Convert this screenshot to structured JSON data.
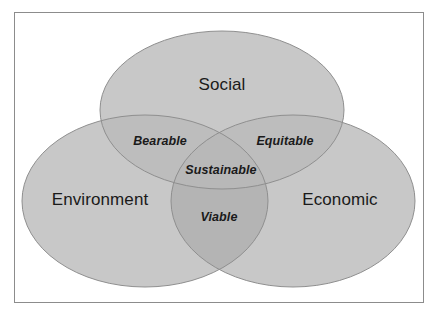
{
  "diagram": {
    "type": "venn",
    "canvas": {
      "width": 439,
      "height": 316,
      "background": "#ffffff"
    },
    "frame": {
      "stroke": "#8c8c8c",
      "fill": "#ffffff"
    },
    "colors": {
      "ellipse_fill": "#c8c8c8",
      "ellipse_stroke": "#8f8f8f",
      "overlap_pair": "#bdbdbd",
      "overlap_triple": "#b6b6b6",
      "label_text": "#1a1a1a",
      "background": "#ffffff"
    },
    "sets": [
      {
        "id": "social",
        "label": "Social",
        "position": "top",
        "cx": 222,
        "cy": 110,
        "rx": 122,
        "ry": 79,
        "label_x": 222,
        "label_y": 85
      },
      {
        "id": "environment",
        "label": "Environment",
        "position": "bottom-left",
        "cx": 145,
        "cy": 201,
        "rx": 123,
        "ry": 86,
        "label_x": 100,
        "label_y": 200
      },
      {
        "id": "economic",
        "label": "Economic",
        "position": "bottom-right",
        "cx": 293,
        "cy": 201,
        "rx": 122,
        "ry": 86,
        "label_x": 340,
        "label_y": 200
      }
    ],
    "intersections": [
      {
        "id": "bearable",
        "label": "Bearable",
        "sets": [
          "social",
          "environment"
        ],
        "label_x": 160,
        "label_y": 141
      },
      {
        "id": "equitable",
        "label": "Equitable",
        "sets": [
          "social",
          "economic"
        ],
        "label_x": 285,
        "label_y": 141
      },
      {
        "id": "viable",
        "label": "Viable",
        "sets": [
          "environment",
          "economic"
        ],
        "label_x": 219,
        "label_y": 217
      },
      {
        "id": "sustainable",
        "label": "Sustainable",
        "sets": [
          "social",
          "environment",
          "economic"
        ],
        "label_x": 221,
        "label_y": 170
      }
    ]
  }
}
